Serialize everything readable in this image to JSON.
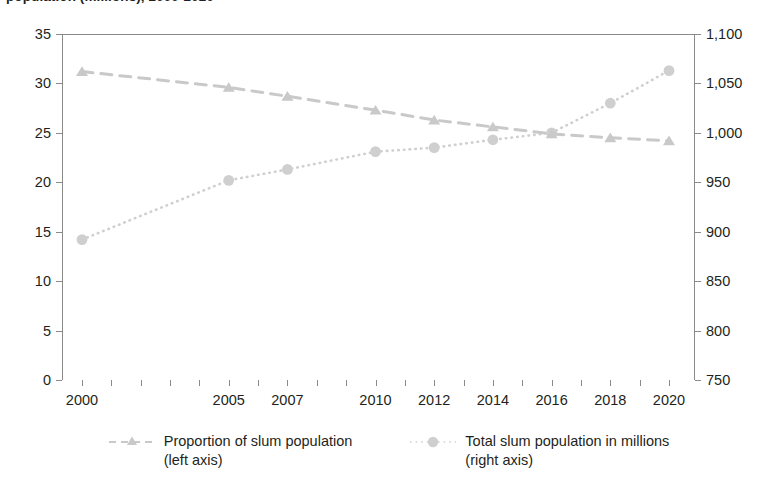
{
  "title": "population (millions), 2000-2020",
  "colors": {
    "proportion_series": "#c9c9c9",
    "total_series": "#cfcfcf",
    "axis": "#8a8a8a",
    "text": "#231f20"
  },
  "axes": {
    "left": {
      "ticks": [
        "0",
        "5",
        "10",
        "15",
        "20",
        "25",
        "30",
        "35"
      ],
      "min": 0,
      "max": 35
    },
    "right": {
      "ticks": [
        "750",
        "800",
        "850",
        "900",
        "950",
        "1,000",
        "1,050",
        "1,100"
      ],
      "min": 750,
      "max": 1100
    },
    "bottom": {
      "ticks": [
        "2000",
        "2005",
        "2007",
        "2010",
        "2012",
        "2014",
        "2016",
        "2018",
        "2020"
      ]
    }
  },
  "legend": {
    "items": [
      {
        "marker": "dashed-line-triangle-marker",
        "label": "Proportion of slum population\n(left axis)"
      },
      {
        "marker": "dotted-line-circle-marker",
        "label": "Total slum population in millions\n(right axis)"
      }
    ]
  },
  "chart_data": {
    "type": "line",
    "title": "population (millions), 2000-2020",
    "xlabel": "",
    "ylabel": "Proportion of slum population",
    "y2label": "Total slum population in millions",
    "grid": false,
    "legend_position": "bottom",
    "x": [
      2000,
      2005,
      2007,
      2010,
      2012,
      2014,
      2016,
      2018,
      2020
    ],
    "categories": [
      "2000",
      "2005",
      "2007",
      "2010",
      "2012",
      "2014",
      "2016",
      "2018",
      "2020"
    ],
    "ylim": [
      0,
      35
    ],
    "y2lim": [
      750,
      1100
    ],
    "series": [
      {
        "name": "Proportion of slum population (left axis)",
        "axis": "left",
        "marker": "triangle",
        "line_style": "dashed",
        "values": [
          31.2,
          29.6,
          28.7,
          27.3,
          26.3,
          25.6,
          24.9,
          24.5,
          24.2
        ]
      },
      {
        "name": "Total slum population in millions (right axis)",
        "axis": "right",
        "marker": "circle",
        "line_style": "dotted",
        "values": [
          892,
          952,
          963,
          981,
          985,
          993,
          1000,
          1030,
          1063
        ]
      }
    ]
  }
}
